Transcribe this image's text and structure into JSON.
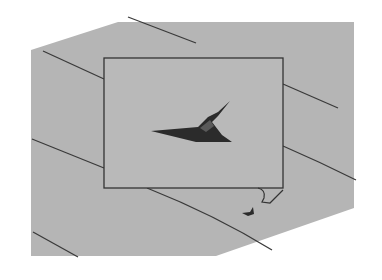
{
  "illustration": {
    "description": "Grayscale drawing of a framed panel on a gray surface with diagonal lines and a dark triangular object",
    "colors": {
      "background": "#ffffff",
      "surface": "#b4b4b4",
      "line": "#3a3a3a",
      "object": "#2b2b2b"
    },
    "surface_polygon": "31,50 118,22 354,22 354,208 216,256 31,256",
    "frame": {
      "x": 104,
      "y": 58,
      "width": 179,
      "height": 130
    },
    "diagonal_lines": [
      {
        "x1": 128,
        "y1": 17,
        "x2": 196,
        "y2": 42
      },
      {
        "x1": 43,
        "y1": 51,
        "x2": 104,
        "y2": 78
      },
      {
        "x1": 283,
        "y1": 83,
        "x2": 338,
        "y2": 108
      },
      {
        "x1": 32,
        "y1": 140,
        "x2": 104,
        "y2": 168
      },
      {
        "x1": 283,
        "y1": 146,
        "x2": 356,
        "y2": 180
      },
      {
        "x1": 147,
        "y1": 188,
        "x2": 272,
        "y2": 250
      },
      {
        "x1": 33,
        "y1": 232,
        "x2": 78,
        "y2": 257
      }
    ]
  }
}
